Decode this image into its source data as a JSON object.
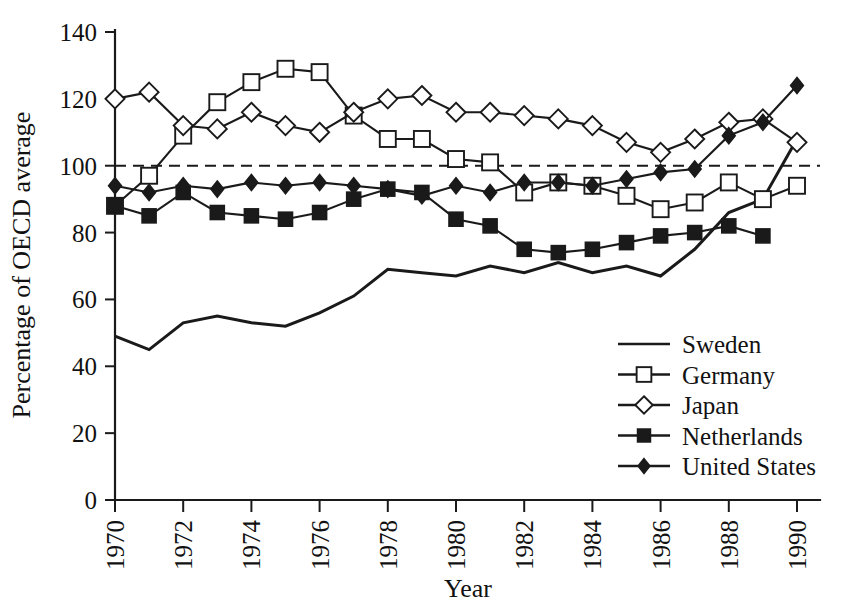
{
  "chart_data": {
    "type": "line",
    "title": "",
    "xlabel": "Year",
    "ylabel": "Percentage of OECD average",
    "xlim": [
      1970,
      1990
    ],
    "ylim": [
      0,
      140
    ],
    "grid": false,
    "legend_position": "lower-right",
    "reference_line": {
      "value": 100,
      "style": "dashed",
      "label": ""
    },
    "x": [
      1970,
      1971,
      1972,
      1973,
      1974,
      1975,
      1976,
      1977,
      1978,
      1979,
      1980,
      1981,
      1982,
      1983,
      1984,
      1985,
      1986,
      1987,
      1988,
      1989,
      1990
    ],
    "xticks": [
      1970,
      1972,
      1974,
      1976,
      1978,
      1980,
      1982,
      1984,
      1986,
      1988,
      1990
    ],
    "xtick_labels": [
      "1970",
      "1972",
      "1974",
      "1976",
      "1978",
      "1980",
      "1982",
      "1984",
      "1986",
      "1988",
      "1990"
    ],
    "yticks": [
      0,
      20,
      40,
      60,
      80,
      100,
      120,
      140
    ],
    "ytick_labels": [
      "0",
      "20",
      "40",
      "60",
      "80",
      "100",
      "120",
      "140"
    ],
    "series": [
      {
        "name": "Sweden",
        "marker": "none",
        "values": [
          49,
          45,
          53,
          55,
          53,
          52,
          56,
          61,
          69,
          68,
          67,
          70,
          68,
          71,
          68,
          70,
          67,
          75,
          86,
          90,
          108
        ]
      },
      {
        "name": "Germany",
        "marker": "open-square",
        "values": [
          88,
          97,
          109,
          119,
          125,
          129,
          128,
          115,
          108,
          108,
          102,
          101,
          92,
          95,
          94,
          91,
          87,
          89,
          95,
          90,
          94
        ]
      },
      {
        "name": "Japan",
        "marker": "open-diamond",
        "values": [
          120,
          122,
          112,
          111,
          116,
          112,
          110,
          116,
          120,
          121,
          116,
          116,
          115,
          114,
          112,
          107,
          104,
          108,
          113,
          114,
          107
        ]
      },
      {
        "name": "Netherlands",
        "marker": "filled-square",
        "values": [
          88,
          85,
          92,
          86,
          85,
          84,
          86,
          90,
          93,
          92,
          84,
          82,
          75,
          74,
          75,
          77,
          79,
          80,
          82,
          79,
          null
        ]
      },
      {
        "name": "United States",
        "marker": "filled-diamond",
        "values": [
          94,
          92,
          94,
          93,
          95,
          94,
          95,
          94,
          93,
          91,
          94,
          92,
          95,
          95,
          94,
          96,
          98,
          99,
          109,
          113,
          124
        ]
      }
    ]
  },
  "legend": {
    "entries": [
      {
        "label": "Sweden",
        "marker": "none"
      },
      {
        "label": "Germany",
        "marker": "open-square"
      },
      {
        "label": "Japan",
        "marker": "open-diamond"
      },
      {
        "label": "Netherlands",
        "marker": "filled-square"
      },
      {
        "label": "United States",
        "marker": "filled-diamond"
      }
    ]
  },
  "axes": {
    "x_title": "Year",
    "y_title": "Percentage of OECD average"
  },
  "colors": {
    "ink": "#1a1a1a",
    "background": "#ffffff",
    "marker_fill_open": "#ffffff",
    "marker_fill_closed": "#1a1a1a"
  }
}
